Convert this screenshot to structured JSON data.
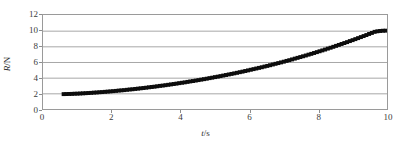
{
  "chart_data": {
    "type": "scatter",
    "title": "",
    "subtitle": "",
    "xlabel": "t/s",
    "ylabel": "R/N",
    "xlabel_italic_part": "t",
    "xlabel_rest": "/s",
    "ylabel_italic_part": "R",
    "ylabel_rest": "/N",
    "xlim": [
      0,
      10
    ],
    "ylim": [
      0,
      12
    ],
    "xticks": [
      0,
      2,
      4,
      6,
      8,
      10
    ],
    "yticks": [
      0,
      2,
      4,
      6,
      8,
      10,
      12
    ],
    "xtick_labels": [
      "0",
      "2",
      "4",
      "6",
      "8",
      "10"
    ],
    "ytick_labels": [
      "0",
      "2",
      "4",
      "6",
      "8",
      "10",
      "12"
    ],
    "grid": true,
    "grid_axis": "y",
    "grid_color": "#a6a6a6",
    "frame_color": "#9a9a9a",
    "legend": false,
    "legend_position": "none",
    "marker": "square",
    "marker_color": "#0d0d0d",
    "marker_size": 2.0,
    "series": [
      {
        "name": "R vs t",
        "x": [
          0.6,
          0.68,
          0.76,
          0.84,
          0.92,
          1.0,
          1.08,
          1.16,
          1.24,
          1.32,
          1.4,
          1.48,
          1.56,
          1.64,
          1.72,
          1.8,
          1.88,
          1.96,
          2.04,
          2.12,
          2.2,
          2.28,
          2.36,
          2.44,
          2.52,
          2.6,
          2.68,
          2.76,
          2.84,
          2.92,
          3.0,
          3.08,
          3.16,
          3.24,
          3.32,
          3.4,
          3.48,
          3.56,
          3.64,
          3.72,
          3.8,
          3.88,
          3.96,
          4.04,
          4.12,
          4.2,
          4.28,
          4.36,
          4.44,
          4.52,
          4.6,
          4.68,
          4.76,
          4.84,
          4.92,
          5.0,
          5.08,
          5.16,
          5.24,
          5.32,
          5.4,
          5.48,
          5.56,
          5.64,
          5.72,
          5.8,
          5.88,
          5.96,
          6.04,
          6.12,
          6.2,
          6.28,
          6.36,
          6.44,
          6.52,
          6.6,
          6.68,
          6.76,
          6.84,
          6.92,
          7.0,
          7.08,
          7.16,
          7.24,
          7.32,
          7.4,
          7.48,
          7.56,
          7.64,
          7.72,
          7.8,
          7.88,
          7.96,
          8.04,
          8.12,
          8.2,
          8.28,
          8.36,
          8.44,
          8.52,
          8.6,
          8.68,
          8.76,
          8.84,
          8.92,
          9.0,
          9.08,
          9.16,
          9.24,
          9.32,
          9.4,
          9.48,
          9.56,
          9.64,
          9.72,
          9.8,
          9.88,
          9.96
        ],
        "y": [
          1.9,
          1.91,
          1.92,
          1.93,
          1.95,
          1.96,
          1.98,
          2.0,
          2.02,
          2.04,
          2.06,
          2.09,
          2.11,
          2.14,
          2.16,
          2.19,
          2.22,
          2.25,
          2.28,
          2.31,
          2.35,
          2.38,
          2.41,
          2.45,
          2.49,
          2.52,
          2.56,
          2.6,
          2.64,
          2.68,
          2.72,
          2.77,
          2.81,
          2.85,
          2.9,
          2.95,
          2.99,
          3.04,
          3.09,
          3.14,
          3.19,
          3.24,
          3.3,
          3.35,
          3.4,
          3.46,
          3.52,
          3.57,
          3.63,
          3.69,
          3.75,
          3.81,
          3.87,
          3.94,
          4.0,
          4.07,
          4.13,
          4.2,
          4.27,
          4.34,
          4.41,
          4.48,
          4.55,
          4.62,
          4.7,
          4.77,
          4.85,
          4.93,
          5.01,
          5.09,
          5.17,
          5.25,
          5.33,
          5.42,
          5.5,
          5.59,
          5.68,
          5.77,
          5.86,
          5.95,
          6.04,
          6.14,
          6.23,
          6.33,
          6.43,
          6.53,
          6.63,
          6.73,
          6.83,
          6.94,
          7.04,
          7.15,
          7.26,
          7.37,
          7.48,
          7.59,
          7.71,
          7.82,
          7.94,
          8.06,
          8.18,
          8.3,
          8.42,
          8.54,
          8.67,
          8.79,
          8.92,
          9.05,
          9.18,
          9.31,
          9.44,
          9.58,
          9.71,
          9.85,
          9.92,
          9.96,
          9.99,
          10.0
        ]
      }
    ]
  }
}
